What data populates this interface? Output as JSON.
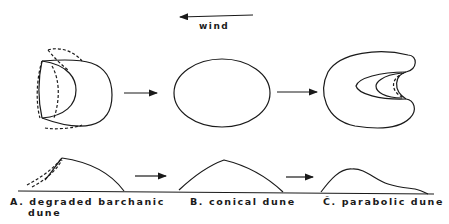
{
  "diagram": {
    "wind_label": "wind",
    "stages": [
      {
        "id": "A",
        "label": "A. degraded barchanic",
        "label_line2": "dune"
      },
      {
        "id": "B",
        "label": "B. conical dune"
      },
      {
        "id": "C",
        "label": "C̆. parabolic dune"
      }
    ],
    "line_color": "#1a1a1a"
  }
}
